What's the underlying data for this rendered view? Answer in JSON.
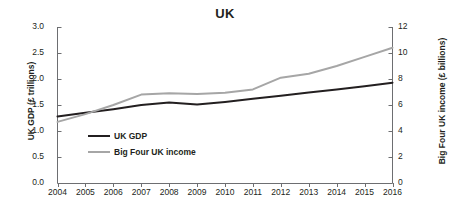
{
  "chart_data": {
    "type": "line",
    "title": "UK",
    "xlabel": "",
    "ylabel": "UK GDP (£ trillions)",
    "y2label": "Big Four UK income (£ billions)",
    "grid": false,
    "legend_position": "inside-left",
    "x": [
      2004,
      2005,
      2006,
      2007,
      2008,
      2009,
      2010,
      2011,
      2012,
      2013,
      2014,
      2015,
      2016
    ],
    "categories": [
      "2004",
      "2005",
      "2006",
      "2007",
      "2008",
      "2009",
      "2010",
      "2011",
      "2012",
      "2013",
      "2014",
      "2015",
      "2016"
    ],
    "ylim": [
      0.0,
      3.0
    ],
    "yticks": [
      "0.0",
      "0.5",
      "1.0",
      "1.5",
      "2.0",
      "2.5",
      "3.0"
    ],
    "ytick_values": [
      0.0,
      0.5,
      1.0,
      1.5,
      2.0,
      2.5,
      3.0
    ],
    "y2lim": [
      0,
      12
    ],
    "y2ticks": [
      "0",
      "2",
      "4",
      "6",
      "8",
      "10",
      "12"
    ],
    "y2tick_values": [
      0,
      2,
      4,
      6,
      8,
      10,
      12
    ],
    "series": [
      {
        "name": "UK GDP",
        "axis": "left",
        "color": "#231f20",
        "values": [
          1.28,
          1.35,
          1.42,
          1.5,
          1.55,
          1.51,
          1.56,
          1.62,
          1.68,
          1.74,
          1.8,
          1.86,
          1.93
        ]
      },
      {
        "name": "Big Four UK income",
        "axis": "right",
        "color": "#a6a6a6",
        "values": [
          4.7,
          5.3,
          6.0,
          6.8,
          6.9,
          6.85,
          6.95,
          7.2,
          8.1,
          8.4,
          9.0,
          9.7,
          10.4
        ]
      }
    ]
  },
  "legend": {
    "items": [
      {
        "label": "UK GDP",
        "color": "#231f20"
      },
      {
        "label": "Big Four UK income",
        "color": "#a6a6a6"
      }
    ]
  }
}
